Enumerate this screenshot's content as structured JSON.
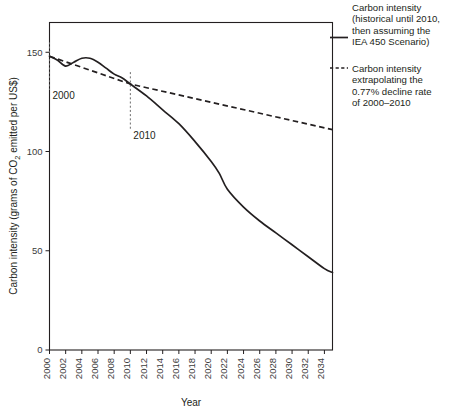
{
  "chart_data": {
    "type": "line",
    "title": "",
    "xlabel": "Year",
    "ylabel": "Carbon intensity (grams of CO₂ emitted per US$)",
    "xlim": [
      2000,
      2035
    ],
    "ylim": [
      0,
      165
    ],
    "yticks": [
      "0",
      "50",
      "100",
      "150"
    ],
    "ytick_values": [
      0,
      50,
      100,
      150
    ],
    "grid": false,
    "legend_position": "right",
    "xticks": [
      "2000",
      "2002",
      "2004",
      "2006",
      "2008",
      "2010",
      "2012",
      "2014",
      "2016",
      "2018",
      "2020",
      "2022",
      "2024",
      "2026",
      "2028",
      "2030",
      "2032",
      "2034"
    ],
    "xtick_values": [
      2000,
      2002,
      2004,
      2006,
      2008,
      2010,
      2012,
      2014,
      2016,
      2018,
      2020,
      2022,
      2024,
      2026,
      2028,
      2030,
      2032,
      2034
    ],
    "series": [
      {
        "name": "Carbon intensity (historical until 2010, then assuming the IEA 450 Scenario)",
        "style": "solid",
        "color": "#231f20",
        "x": [
          2000,
          2001,
          2002,
          2003,
          2004,
          2005,
          2006,
          2007,
          2008,
          2009,
          2010,
          2012,
          2014,
          2016,
          2018,
          2020,
          2021,
          2022,
          2024,
          2026,
          2028,
          2030,
          2032,
          2034,
          2035
        ],
        "values": [
          148,
          146,
          143,
          145,
          147,
          147,
          145,
          142,
          139,
          137,
          134,
          128,
          121,
          114,
          105,
          95,
          89,
          81,
          72,
          65,
          59,
          53,
          47,
          41,
          39
        ]
      },
      {
        "name": "Carbon intensity extrapolating the 0.77% decline rate of 2000–2010",
        "style": "dashed",
        "color": "#231f20",
        "x": [
          2000,
          2010,
          2035
        ],
        "values": [
          148,
          134,
          111
        ]
      }
    ],
    "annotations": [
      {
        "label": "2000",
        "x": 2000,
        "type": "vertical-marker",
        "y_top": 155,
        "y_bottom": 131
      },
      {
        "label": "2010",
        "x": 2010,
        "type": "vertical-marker",
        "y_top": 140,
        "y_bottom": 111
      }
    ]
  },
  "legend": {
    "entries": [
      {
        "swatch": "solid-line",
        "lines": [
          "Carbon intensity",
          "(historical until 2010,",
          "then assuming the",
          "IEA 450 Scenario)"
        ]
      },
      {
        "swatch": "dashed-line",
        "lines": [
          "Carbon intensity",
          "extrapolating the",
          "0.77% decline rate",
          "of 2000–2010"
        ]
      }
    ]
  }
}
